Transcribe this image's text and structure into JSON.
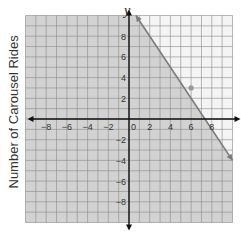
{
  "chart_data": {
    "type": "line",
    "title": "",
    "xlabel": "x",
    "ylabel": "y",
    "side_label": "Number of Carousel Rides",
    "xlim": [
      -10,
      10
    ],
    "ylim": [
      -10,
      10
    ],
    "grid": true,
    "x_ticks": [
      -8,
      -6,
      -4,
      -2,
      0,
      2,
      4,
      6,
      8
    ],
    "y_ticks": [
      -8,
      -6,
      -4,
      -2,
      2,
      4,
      6,
      8
    ],
    "series": [
      {
        "name": "boundary line",
        "style": "solid",
        "equation": "y = -1.5x + 11",
        "x": [
          0.67,
          10
        ],
        "y": [
          10,
          -4
        ]
      }
    ],
    "points": [
      {
        "x": 6,
        "y": 3,
        "label": ""
      }
    ],
    "shading": "region below the boundary line",
    "colors": {
      "shaded": "#d2d2d2",
      "unshaded": "#f4f4f4",
      "grid": "#8a8a8a",
      "axis": "#111111",
      "line": "#7a7a7a",
      "point": "#999999"
    }
  }
}
